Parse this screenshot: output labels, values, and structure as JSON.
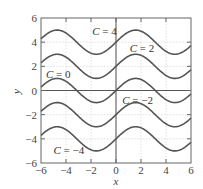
{
  "chart_data": {
    "type": "line",
    "title": "",
    "xlabel": "x",
    "ylabel": "y",
    "xlim": [
      -6,
      6
    ],
    "ylim": [
      -6,
      6
    ],
    "xticks": [
      -6,
      -4,
      -2,
      0,
      2,
      4,
      6
    ],
    "yticks": [
      -6,
      -4,
      -2,
      0,
      2,
      4,
      6
    ],
    "xtick_labels": [
      "−6",
      "−4",
      "−2",
      "0",
      "2",
      "4",
      "6"
    ],
    "ytick_labels": [
      "−6",
      "−4",
      "−2",
      "0",
      "2",
      "4",
      "6"
    ],
    "grid": true,
    "function": "y = sin(x) + C",
    "series": [
      {
        "name": "C = 4",
        "C": 4,
        "label_text": "C = 4",
        "label_at": [
          -1.9,
          4.9
        ]
      },
      {
        "name": "C = 2",
        "C": 2,
        "label_text": "C = 2",
        "label_at": [
          1.1,
          3.5
        ]
      },
      {
        "name": "C = 0",
        "C": 0,
        "label_text": "C = 0",
        "label_at": [
          -5.6,
          1.4
        ]
      },
      {
        "name": "C = −2",
        "C": -2,
        "label_text": "C = −2",
        "label_at": [
          0.5,
          -0.8
        ]
      },
      {
        "name": "C = −4",
        "C": -4,
        "label_text": "C = −4",
        "label_at": [
          -5.0,
          -4.9
        ]
      }
    ],
    "colors": {
      "curve": "#555555",
      "axis": "#555555",
      "frame": "#666666",
      "grid": "#cccccc"
    }
  }
}
